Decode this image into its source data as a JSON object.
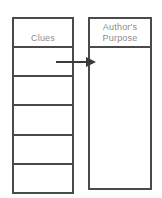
{
  "diagram": {
    "type": "graphic-organizer",
    "background_color": "#ffffff",
    "line_color": "#4a4a4a",
    "text_color": "#8c8c8c",
    "columns": [
      {
        "id": "clues",
        "header": "Clues",
        "rows": [
          "",
          "",
          "",
          "",
          ""
        ],
        "row_count": 5
      },
      {
        "id": "authors-purpose",
        "header_line1": "Author's",
        "header_line2": "Purpose",
        "header": "Author's Purpose",
        "body": ""
      }
    ],
    "connector": {
      "name": "arrow",
      "from": "clues-row-1",
      "to": "authors-purpose",
      "direction": "right",
      "color": "#3a3a3a"
    }
  }
}
